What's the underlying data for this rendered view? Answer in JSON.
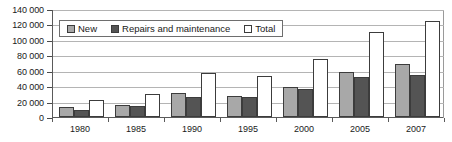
{
  "chart_data": {
    "type": "bar",
    "title": "",
    "xlabel": "",
    "ylabel": "",
    "categories": [
      "1980",
      "1985",
      "1990",
      "1995",
      "2000",
      "2005",
      "2007"
    ],
    "series": [
      {
        "name": "New",
        "values": [
          13000,
          15500,
          31000,
          27000,
          39000,
          58000,
          69000
        ]
      },
      {
        "name": "Repairs and maintenance",
        "values": [
          9500,
          14500,
          26000,
          26000,
          36000,
          52000,
          55000
        ]
      },
      {
        "name": "Total",
        "values": [
          22500,
          30000,
          57000,
          53000,
          75000,
          110000,
          125000
        ]
      }
    ],
    "ylim": [
      0,
      140000
    ],
    "ytick_values": [
      0,
      20000,
      40000,
      60000,
      80000,
      100000,
      120000,
      140000
    ],
    "ytick_labels": [
      "0",
      "20 000",
      "40 000",
      "60 000",
      "80 000",
      "100 000",
      "120 000",
      "140 000"
    ],
    "grid": true,
    "legend_position": "top-left",
    "colors": {
      "new": "#a8a8a8",
      "repairs": "#545454",
      "total": "#ffffff",
      "bar_outline": "#3c3c3c",
      "gridline": "#b4b4b4",
      "axis": "#5a5a5a",
      "text": "#1a1a1a",
      "background": "#ffffff"
    }
  },
  "legend": {
    "entries": [
      {
        "label": "New",
        "series_key": "new"
      },
      {
        "label": "Repairs and maintenance",
        "series_key": "repairs"
      },
      {
        "label": "Total",
        "series_key": "total"
      }
    ]
  }
}
